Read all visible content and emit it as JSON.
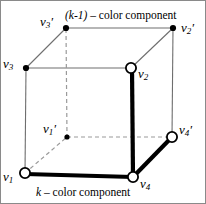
{
  "figure": {
    "type": "cube-diagram",
    "width": 206,
    "height": 204,
    "background": "#ffffff",
    "border_color": "#8a8a8a"
  },
  "captions": {
    "top": {
      "math": "(k-1)",
      "text": " – color component"
    },
    "bottom": {
      "math": "k",
      "text": " – color component"
    }
  },
  "vertices": {
    "v3p": {
      "label": "v",
      "sub": "3",
      "prime": "′",
      "x": 65,
      "y": 27,
      "marker": "filled-dot"
    },
    "v2p": {
      "label": "v",
      "sub": "2",
      "prime": "′",
      "x": 172,
      "y": 27,
      "marker": "filled-dot"
    },
    "v3": {
      "label": "v",
      "sub": "3",
      "prime": "",
      "x": 25,
      "y": 67,
      "marker": "filled-dot"
    },
    "v2": {
      "label": "v",
      "sub": "2",
      "prime": "",
      "x": 130,
      "y": 67,
      "marker": "open-circle"
    },
    "v1p": {
      "label": "v",
      "sub": "1",
      "prime": "′",
      "x": 66,
      "y": 136,
      "marker": "small-filled-dot"
    },
    "v4p": {
      "label": "v",
      "sub": "4",
      "prime": "′",
      "x": 171,
      "y": 136,
      "marker": "open-circle"
    },
    "v1": {
      "label": "v",
      "sub": "1",
      "prime": "",
      "x": 24,
      "y": 172,
      "marker": "open-circle"
    },
    "v4": {
      "label": "v",
      "sub": "4",
      "prime": "",
      "x": 132,
      "y": 176,
      "marker": "open-circle"
    }
  },
  "colors": {
    "thin_edge": "#6e6e6e",
    "thick_edge": "#000000",
    "dashed_edge": "#9a9a9a",
    "marker_stroke": "#000000",
    "marker_fill": "#ffffff"
  },
  "edges": [
    {
      "from": "v3",
      "to": "v2",
      "style": "thin"
    },
    {
      "from": "v3",
      "to": "v1",
      "style": "thin"
    },
    {
      "from": "v3",
      "to": "v3p",
      "style": "thin"
    },
    {
      "from": "v3p",
      "to": "v2p",
      "style": "thin"
    },
    {
      "from": "v2p",
      "to": "v2",
      "style": "thin"
    },
    {
      "from": "v2p",
      "to": "v4p",
      "style": "thin"
    },
    {
      "from": "v1",
      "to": "v4",
      "style": "thick"
    },
    {
      "from": "v2",
      "to": "v4",
      "style": "thick"
    },
    {
      "from": "v4",
      "to": "v4p",
      "style": "thick"
    },
    {
      "from": "v3p",
      "to": "v1p",
      "style": "dashed"
    },
    {
      "from": "v1p",
      "to": "v4p",
      "style": "dashed"
    },
    {
      "from": "v1",
      "to": "v1p",
      "style": "dashed"
    }
  ]
}
